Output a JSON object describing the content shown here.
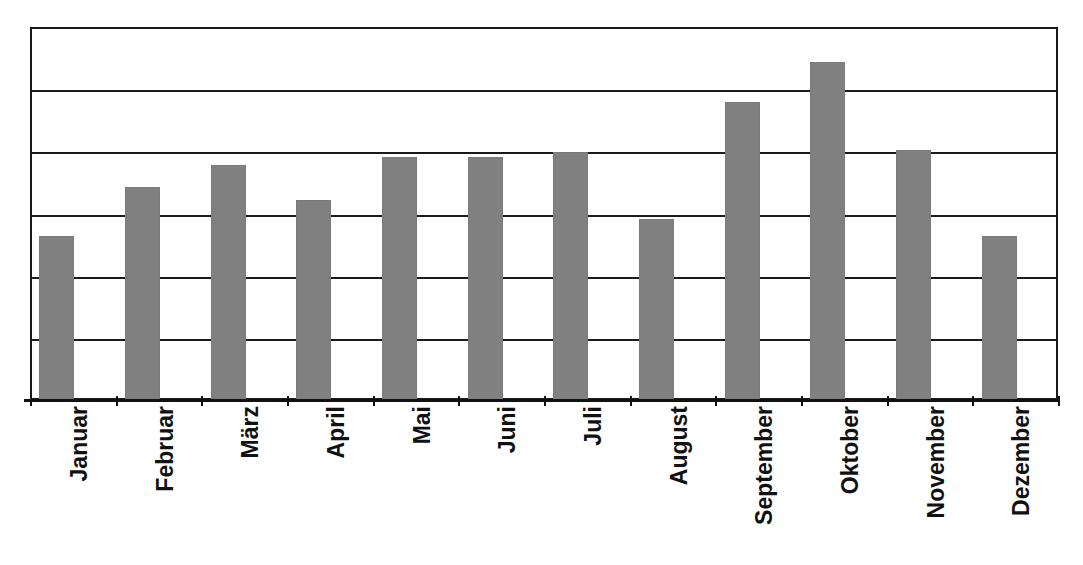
{
  "chart_data": {
    "type": "bar",
    "title": "",
    "subtitle": "",
    "xlabel": "",
    "ylabel": "",
    "categories": [
      "Januar",
      "Februar",
      "März",
      "April",
      "Mai",
      "Juni",
      "Juli",
      "August",
      "September",
      "Oktober",
      "November",
      "Dezember"
    ],
    "values": [
      2.64,
      3.42,
      3.78,
      3.22,
      3.91,
      3.91,
      3.99,
      2.91,
      4.79,
      5.43,
      4.02,
      2.64
    ],
    "ylim": [
      0,
      6
    ],
    "y_gridline_values": [
      0,
      1,
      2,
      3,
      4,
      5,
      6
    ],
    "y_tick_labels": [],
    "grid": true,
    "legend": false,
    "legend_position": "none",
    "bar_color": "#808080",
    "axis_color": "#111111",
    "gridline_color": "#1a1a1a",
    "background_color": "#ffffff",
    "annotations": []
  },
  "axis": {
    "x_tick_count": 13
  }
}
